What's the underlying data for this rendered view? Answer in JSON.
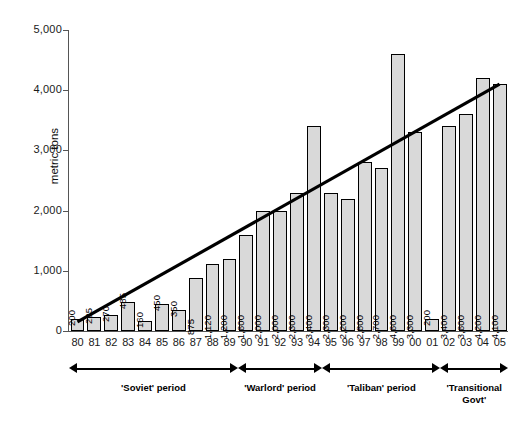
{
  "chart_data": {
    "type": "bar",
    "title": "",
    "subtitle": "",
    "xlabel": "",
    "ylabel": "metric tons",
    "ylim": [
      0,
      5000
    ],
    "ytick_labels": [
      "5,000",
      "4,000",
      "3,000",
      "2,000",
      "1,000",
      "0"
    ],
    "ytick_values": [
      5000,
      4000,
      3000,
      2000,
      1000,
      0
    ],
    "grid": false,
    "legend": "none",
    "categories": [
      "80",
      "81",
      "82",
      "83",
      "84",
      "85",
      "86",
      "87",
      "88",
      "89",
      "90",
      "91",
      "92",
      "93",
      "94",
      "95",
      "96",
      "97",
      "98",
      "99",
      "00",
      "01",
      "02",
      "03",
      "04",
      "05"
    ],
    "values": [
      200,
      225,
      270,
      485,
      160,
      450,
      350,
      875,
      1120,
      1200,
      1600,
      2000,
      2000,
      2300,
      3400,
      2300,
      2200,
      2800,
      2700,
      4600,
      3300,
      200,
      3400,
      3600,
      4200,
      4100
    ],
    "data_labels": [
      "200",
      "225",
      "270",
      "485",
      "160",
      "450",
      "350",
      "875",
      "1,120",
      "1,200",
      "1,600",
      "2,000",
      "2,000",
      "2,300",
      "3,400",
      "2,300",
      "2,200",
      "2,800",
      "2,700",
      "4,600",
      "3,300",
      "200",
      "3,400",
      "3,600",
      "4,200",
      "4,100"
    ],
    "series": [
      {
        "name": "opium production",
        "type": "bar",
        "values": [
          200,
          225,
          270,
          485,
          160,
          450,
          350,
          875,
          1120,
          1200,
          1600,
          2000,
          2000,
          2300,
          3400,
          2300,
          2200,
          2800,
          2700,
          4600,
          3300,
          200,
          3400,
          3600,
          4200,
          4100
        ]
      },
      {
        "name": "trend line",
        "type": "line",
        "start_value": 150,
        "end_value": 4100
      }
    ],
    "annotations": [
      {
        "label": "'Soviet' period",
        "from": "80",
        "to": "89"
      },
      {
        "label": "'Warlord' period",
        "from": "90",
        "to": "94"
      },
      {
        "label": "'Taliban' period",
        "from": "95",
        "to": "01"
      },
      {
        "label": "'Transitional Govt'",
        "from": "02",
        "to": "05"
      }
    ],
    "colors": {
      "bar_fill": "#d9d9d9",
      "bar_stroke": "#000000",
      "trend_line": "#000000",
      "axis": "#555555",
      "text": "#1a1a1a"
    }
  },
  "axis": {
    "y_label": "metric tons"
  },
  "periods": [
    {
      "label": "'Soviet' period",
      "line2": ""
    },
    {
      "label": "'Warlord' period",
      "line2": ""
    },
    {
      "label": "'Taliban' period",
      "line2": ""
    },
    {
      "label": "'Transitional",
      "line2": "Govt'"
    }
  ]
}
